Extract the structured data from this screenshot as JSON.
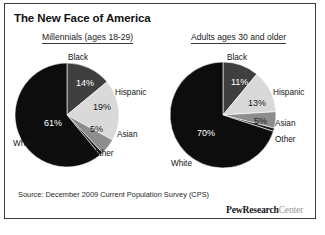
{
  "figure": {
    "title": "The New Face of America",
    "source": "Source: December 2009 Current Population Survey (CPS)",
    "brand_primary": "PewResearch",
    "brand_secondary": "Center",
    "bottom_caption": "",
    "border_color": "#3c3c3c",
    "background": "#ffffff"
  },
  "colors": {
    "white_slice": "#0d0d0d",
    "black_slice": "#3f3f3f",
    "hispanic_slice": "#d9d9d9",
    "asian_slice": "#8d8d8d",
    "other_slice": "#1a1a1a",
    "label_dark": "#141414",
    "label_light": "#ffffff"
  },
  "chart_data": [
    {
      "type": "pie",
      "id": "millennials",
      "title": "Millennials (ages 18-29)",
      "categories": [
        "Black",
        "Hispanic",
        "Asian",
        "Other",
        "White"
      ],
      "values": [
        14,
        19,
        5,
        1,
        61
      ],
      "value_labels": [
        "14%",
        "19%",
        "5%",
        "",
        "61%"
      ],
      "legend": "labels-around-pie",
      "grid": false
    },
    {
      "type": "pie",
      "id": "adults-30-and-older",
      "title": "Adults ages 30 and older",
      "categories": [
        "Black",
        "Hispanic",
        "Asian",
        "Other",
        "White"
      ],
      "values": [
        11,
        13,
        5,
        1,
        70
      ],
      "value_labels": [
        "11%",
        "13%",
        "5%",
        "",
        "70%"
      ],
      "legend": "labels-around-pie",
      "grid": false
    }
  ],
  "panels": {
    "left": {
      "heading": "Millennials (ages 18-29)",
      "cat_labels": [
        {
          "text": "Black",
          "x": 69,
          "y": 12,
          "anchor": "middle"
        },
        {
          "text": "Hispanic",
          "x": 106,
          "y": 47,
          "anchor": "start"
        },
        {
          "text": "Asian",
          "x": 108,
          "y": 89,
          "anchor": "start"
        },
        {
          "text": "Other",
          "x": 84,
          "y": 108,
          "anchor": "start"
        },
        {
          "text": "White",
          "x": 4,
          "y": 98,
          "anchor": "start"
        }
      ],
      "pct_labels": [
        {
          "text": "14%",
          "x": 67,
          "y": 38,
          "fill": "#ffffff"
        },
        {
          "text": "19%",
          "x": 84,
          "y": 62,
          "fill": "#1a1a1a"
        },
        {
          "text": "5%",
          "x": 81,
          "y": 84,
          "fill": "#1a1a1a"
        },
        {
          "text": "61%",
          "x": 35,
          "y": 78,
          "fill": "#ffffff"
        }
      ]
    },
    "right": {
      "heading": "Adults ages 30 and older",
      "cat_labels": [
        {
          "text": "Black",
          "x": 74,
          "y": 12,
          "anchor": "middle"
        },
        {
          "text": "Hispanic",
          "x": 110,
          "y": 47,
          "anchor": "start"
        },
        {
          "text": "Asian",
          "x": 112,
          "y": 78,
          "anchor": "start"
        },
        {
          "text": "Other",
          "x": 112,
          "y": 94,
          "anchor": "start"
        },
        {
          "text": "White",
          "x": 8,
          "y": 118,
          "anchor": "start"
        }
      ],
      "pct_labels": [
        {
          "text": "11%",
          "x": 68,
          "y": 37,
          "fill": "#ffffff"
        },
        {
          "text": "13%",
          "x": 85,
          "y": 58,
          "fill": "#1a1a1a"
        },
        {
          "text": "5%",
          "x": 91,
          "y": 76,
          "fill": "#1a1a1a"
        },
        {
          "text": "70%",
          "x": 34,
          "y": 88,
          "fill": "#ffffff"
        }
      ]
    }
  }
}
